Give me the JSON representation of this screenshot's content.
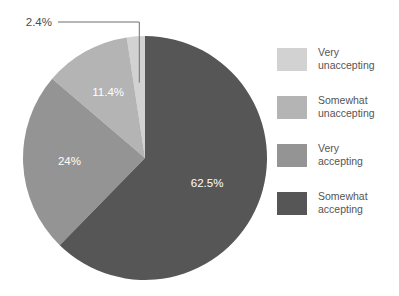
{
  "chart_data": {
    "type": "pie",
    "title": "",
    "subtitle": "",
    "xlabel": "",
    "ylabel": "",
    "grid": false,
    "legend_position": "right",
    "categories": [
      "Very unaccepting",
      "Somewhat unaccepting",
      "Very accepting",
      "Somewhat accepting"
    ],
    "values": [
      2.4,
      11.4,
      24,
      62.5
    ],
    "value_labels": [
      "2.4%",
      "11.4%",
      "24%",
      "62.5%"
    ],
    "colors": [
      "#d2d2d2",
      "#b4b4b4",
      "#949494",
      "#565656"
    ],
    "start_angle_deg": 0,
    "direction": "counterclockwise",
    "slices": [
      {
        "label": "Very unaccepting",
        "value": 2.4,
        "value_label": "2.4%",
        "color": "#d2d2d2",
        "label_placement": "outside-callout"
      },
      {
        "label": "Somewhat unaccepting",
        "value": 11.4,
        "value_label": "11.4%",
        "color": "#b4b4b4",
        "label_placement": "inside"
      },
      {
        "label": "Very accepting",
        "value": 24,
        "value_label": "24%",
        "color": "#949494",
        "label_placement": "inside"
      },
      {
        "label": "Somewhat accepting",
        "value": 62.5,
        "value_label": "62.5%",
        "color": "#565656",
        "label_placement": "inside"
      }
    ]
  },
  "legend": {
    "items": [
      {
        "label": "Very\nunaccepting",
        "color": "#d2d2d2"
      },
      {
        "label": "Somewhat\nunaccepting",
        "color": "#b4b4b4"
      },
      {
        "label": "Very\naccepting",
        "color": "#949494"
      },
      {
        "label": "Somewhat\naccepting",
        "color": "#565656"
      }
    ]
  },
  "labels": {
    "callout": "2.4%",
    "inside": [
      "11.4%",
      "24%",
      "62.5%"
    ]
  },
  "colors": {
    "background": "#ffffff",
    "label_text": "#ffffff",
    "callout_text": "#4c4c4c",
    "leader_line": "#6e6e6e",
    "legend_text": "#555555"
  }
}
